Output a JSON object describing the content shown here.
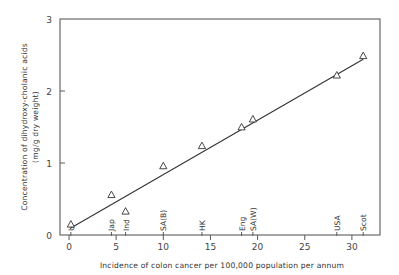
{
  "chart_data": {
    "type": "scatter",
    "title": "",
    "xlabel": "Incidence of colon cancer per 100,000 population per annum",
    "ylabel": "Concentration of dihydroxy-cholanic acids",
    "ylabel_units": "(mg/g dry weight)",
    "xlim": [
      0,
      33
    ],
    "ylim": [
      0,
      3
    ],
    "x_ticks": [
      0,
      5,
      10,
      15,
      20,
      25,
      30
    ],
    "x_tick_labels": [
      "0",
      "5",
      "10",
      "15",
      "20",
      "25",
      "30"
    ],
    "y_ticks": [
      0,
      1,
      2,
      3
    ],
    "y_tick_labels": [
      "0",
      "1",
      "2",
      "3"
    ],
    "grid": false,
    "legend": null,
    "marker": "open-triangle",
    "series": [
      {
        "name": "Countries",
        "points": [
          {
            "label": "U",
            "x": 0.2,
            "y": 0.15
          },
          {
            "label": "Jap",
            "x": 4.5,
            "y": 0.56
          },
          {
            "label": "Ind",
            "x": 6.0,
            "y": 0.33
          },
          {
            "label": "SA(B)",
            "x": 10.0,
            "y": 0.96
          },
          {
            "label": "HK",
            "x": 14.1,
            "y": 1.24
          },
          {
            "label": "Eng",
            "x": 18.3,
            "y": 1.5
          },
          {
            "label": "SA(W)",
            "x": 19.5,
            "y": 1.61
          },
          {
            "label": "USA",
            "x": 28.4,
            "y": 2.22
          },
          {
            "label": "Scot",
            "x": 31.2,
            "y": 2.49
          }
        ]
      }
    ],
    "regression_line": {
      "x": [
        0.1,
        31.2
      ],
      "y": [
        0.09,
        2.44
      ]
    },
    "annotations": [
      "U",
      "Jap",
      "Ind",
      "SA(B)",
      "HK",
      "Eng",
      "SA(W)",
      "USA",
      "Scot"
    ]
  }
}
